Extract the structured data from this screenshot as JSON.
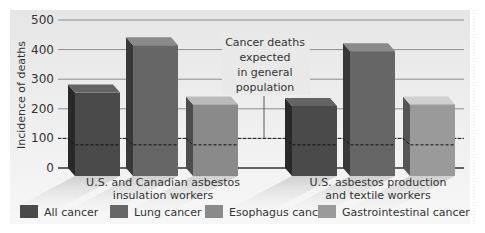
{
  "chart_data": {
    "type": "bar",
    "title": "",
    "xlabel": "",
    "ylabel": "Incidence of deaths",
    "ylim": [
      0,
      500
    ],
    "yticks": [
      0,
      100,
      200,
      300,
      400,
      500
    ],
    "grid": true,
    "legend_position": "bottom",
    "groups": [
      {
        "label_lines": [
          "U.S. and Canadian asbestos",
          "insulation workers"
        ],
        "bars": [
          {
            "series": "All cancer",
            "value": 275,
            "expected": 85
          },
          {
            "series": "Lung cancer",
            "value": 435,
            "expected": 85
          },
          {
            "series": "Esophagus cancer",
            "value": 235,
            "expected": 85
          }
        ]
      },
      {
        "label_lines": [
          "U.S. asbestos production",
          "and textile workers"
        ],
        "bars": [
          {
            "series": "All cancer",
            "value": 230,
            "expected": 85
          },
          {
            "series": "Lung cancer",
            "value": 415,
            "expected": 85
          },
          {
            "series": "Gastrointestinal cancer",
            "value": 235,
            "expected": 85
          }
        ]
      }
    ],
    "expected_baseline": 100,
    "annotation_lines": [
      "Cancer deaths",
      "expected",
      "in general",
      "population"
    ],
    "legend": [
      {
        "label": "All cancer",
        "color": "#4a4a4a"
      },
      {
        "label": "Lung cancer",
        "color": "#666666"
      },
      {
        "label": "Esophagus cancer",
        "color": "#8a8a8a"
      },
      {
        "label": "Gastrointestinal cancer",
        "color": "#9a9a9a"
      }
    ]
  },
  "colors": {
    "background_panel": "#ececec",
    "grid": "#777777",
    "axis": "#333333"
  }
}
